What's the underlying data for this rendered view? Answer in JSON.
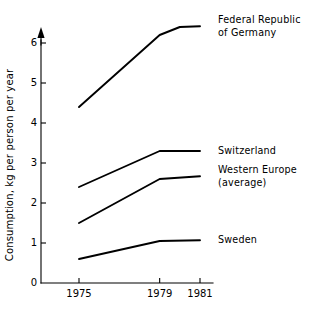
{
  "chart_data": {
    "type": "line",
    "title": "",
    "xlabel": "",
    "ylabel": "Consumption, kg per person per year",
    "x": [
      1975,
      1979,
      1981
    ],
    "xtick_labels": [
      "1975",
      "1979",
      "1981"
    ],
    "ytick_labels": [
      "0",
      "1",
      "2",
      "3",
      "4",
      "5",
      "6"
    ],
    "ytick_values": [
      0,
      1,
      2,
      3,
      4,
      5,
      6
    ],
    "ylim": [
      0,
      6.6
    ],
    "xlim": [
      1975,
      1981
    ],
    "grid": false,
    "legend_position": "right-inline",
    "series": [
      {
        "name": "Federal Republic of Germany",
        "label_lines": [
          "Federal Republic",
          "of Germany"
        ],
        "x": [
          1975,
          1979,
          1980,
          1981
        ],
        "values": [
          4.4,
          6.2,
          6.4,
          6.42
        ]
      },
      {
        "name": "Switzerland",
        "label_lines": [
          "Switzerland"
        ],
        "x": [
          1975,
          1979,
          1981
        ],
        "values": [
          2.4,
          3.3,
          3.3
        ]
      },
      {
        "name": "Western Europe (average)",
        "label_lines": [
          "Western Europe",
          "(average)"
        ],
        "x": [
          1975,
          1979,
          1981
        ],
        "values": [
          1.5,
          2.6,
          2.67
        ]
      },
      {
        "name": "Sweden",
        "label_lines": [
          "Sweden"
        ],
        "x": [
          1975,
          1979,
          1981
        ],
        "values": [
          0.6,
          1.05,
          1.07
        ]
      }
    ]
  },
  "axis": {
    "y_arrow": "arrow-up-icon",
    "y_title": "Consumption, kg per person per year"
  }
}
